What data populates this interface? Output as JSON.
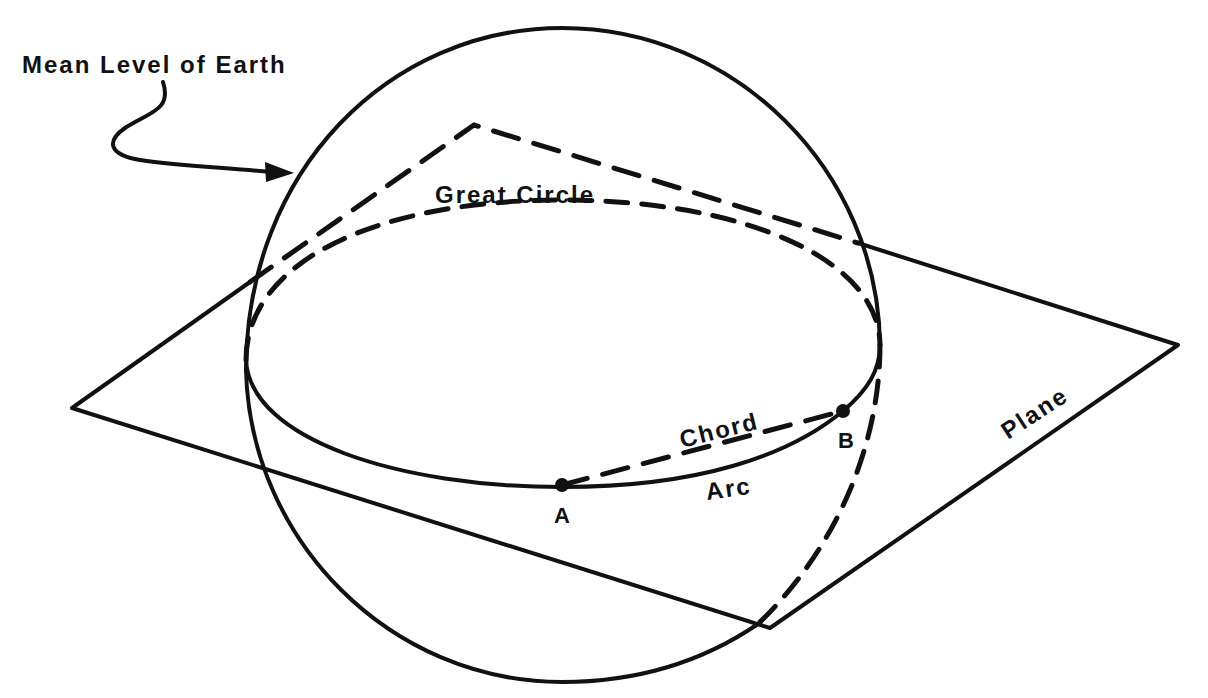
{
  "diagram": {
    "type": "geometry-illustration",
    "labels": {
      "mean_level": "Mean Level of Earth",
      "great_circle": "Great Circle",
      "chord": "Chord",
      "arc": "Arc",
      "plane": "Plane",
      "point_a": "A",
      "point_b": "B"
    },
    "colors": {
      "ink": "#111111",
      "background": "#ffffff"
    },
    "elements": [
      {
        "id": "sphere",
        "shape": "circle",
        "style": "solid",
        "label": "Mean Level of Earth"
      },
      {
        "id": "plane",
        "shape": "parallelogram",
        "style": "solid/dashed (hidden edges dashed)",
        "label": "Plane"
      },
      {
        "id": "great-circle",
        "shape": "ellipse",
        "style": "front half solid, back half dashed",
        "label": "Great Circle"
      },
      {
        "id": "chord",
        "shape": "line",
        "style": "dashed",
        "from": "A",
        "to": "B",
        "label": "Chord"
      },
      {
        "id": "arc",
        "shape": "curve",
        "style": "solid",
        "from": "A",
        "to": "B",
        "label": "Arc"
      }
    ],
    "points": [
      {
        "name": "A"
      },
      {
        "name": "B"
      }
    ]
  }
}
